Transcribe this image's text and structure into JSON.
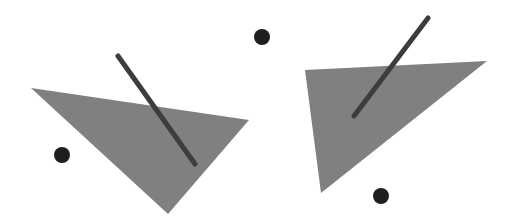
{
  "canvas": {
    "width": 517,
    "height": 223,
    "background": "#ffffff"
  },
  "colors": {
    "triangle_fill": "#808080",
    "stick": "#3d3d3d",
    "dot": "#1e1e1e"
  },
  "figures": [
    {
      "name": "left",
      "triangle": "31,88 249,120 168,214",
      "stick": {
        "x1": 118,
        "y1": 56,
        "x2": 195,
        "y2": 164,
        "width": 5
      },
      "dot": {
        "cx": 62,
        "cy": 155,
        "r": 8
      }
    },
    {
      "name": "right",
      "triangle": "305,70 487,61 321,193",
      "stick": {
        "x1": 428,
        "y1": 18,
        "x2": 354,
        "y2": 116,
        "width": 5
      },
      "dot": {
        "cx": 381,
        "cy": 196,
        "r": 8
      }
    }
  ],
  "extra_dots": [
    {
      "cx": 262,
      "cy": 37,
      "r": 8
    }
  ]
}
